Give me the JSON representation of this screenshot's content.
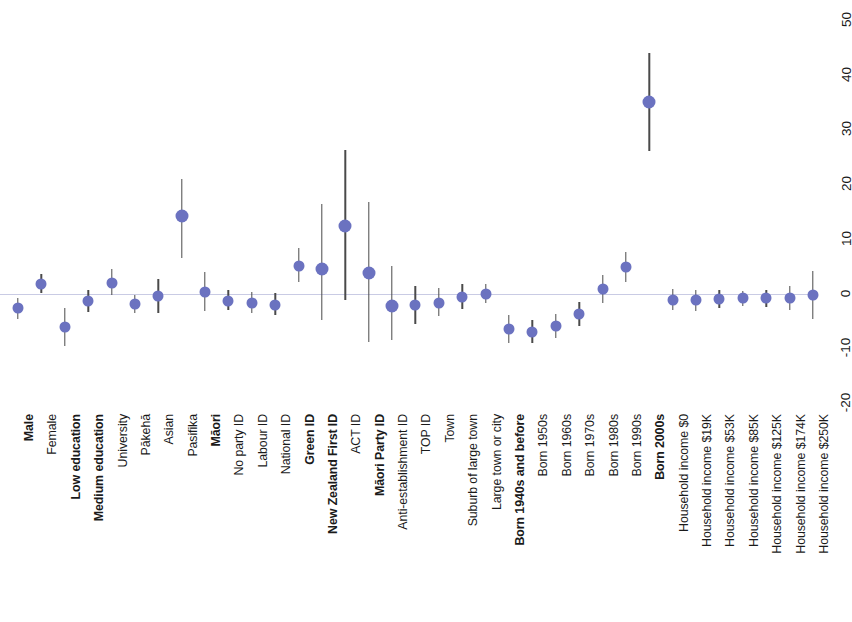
{
  "chart_data": {
    "type": "scatter",
    "title": "",
    "subtitle": "",
    "xlabel": "",
    "ylabel": "",
    "ylim": [
      -20,
      50
    ],
    "yticks": [
      -20,
      -10,
      0,
      10,
      20,
      30,
      40,
      50
    ],
    "grid": false,
    "legend": null,
    "zero_reference_line": 0,
    "point_color": "#6b72c0",
    "error_bar_color": "#4a4a4a",
    "zero_line_color": "#c9cbe4",
    "categories": [
      "Male",
      "Female",
      "Low education",
      "Medium education",
      "University",
      "Pākehā",
      "Asian",
      "Pasifika",
      "Māori",
      "No party ID",
      "Labour ID",
      "National ID",
      "Green ID",
      "New Zealand First ID",
      "ACT ID",
      "Māori Party ID",
      "Anti-establishment ID",
      "TOP ID",
      "Town",
      "Suburb of large town",
      "Large town or city",
      "Born 1940s and before",
      "Born 1950s",
      "Born 1960s",
      "Born 1970s",
      "Born 1980s",
      "Born 1990s",
      "Born 2000s",
      "Household income $0",
      "Household income $19K",
      "Household income $53K",
      "Household income $85K",
      "Household income $125K",
      "Household income $174K",
      "Household income $250K"
    ],
    "bold_categories": [
      "Male",
      "Low education",
      "Medium education",
      "Māori",
      "Green ID",
      "New Zealand First ID",
      "Māori Party ID",
      "Born 1940s and before",
      "Born 2000s"
    ],
    "points": [
      {
        "label": "Male",
        "value": -2.7,
        "low": -4.6,
        "high": -0.9
      },
      {
        "label": "Female",
        "value": 1.8,
        "low": 0.1,
        "high": 3.5
      },
      {
        "label": "Low education",
        "value": -6.1,
        "low": -9.5,
        "high": -2.7
      },
      {
        "label": "Medium education",
        "value": -1.3,
        "low": -3.3,
        "high": 0.7
      },
      {
        "label": "University",
        "value": 1.9,
        "low": -0.2,
        "high": 4.4
      },
      {
        "label": "Pākehā",
        "value": -1.9,
        "low": -3.5,
        "high": -0.3
      },
      {
        "label": "Asian",
        "value": -0.4,
        "low": -3.5,
        "high": 2.7
      },
      {
        "label": "Pasifika",
        "value": 14.2,
        "low": 6.5,
        "high": 21.0
      },
      {
        "label": "Māori",
        "value": 0.3,
        "low": -3.2,
        "high": 3.9
      },
      {
        "label": "No party ID",
        "value": -1.3,
        "low": -3.0,
        "high": 0.6
      },
      {
        "label": "Labour ID",
        "value": -1.7,
        "low": -3.5,
        "high": 0.2
      },
      {
        "label": "National ID",
        "value": -2.0,
        "low": -4.0,
        "high": 0.1
      },
      {
        "label": "Green ID",
        "value": 5.0,
        "low": 2.1,
        "high": 8.4
      },
      {
        "label": "New Zealand First ID",
        "value": 4.5,
        "low": -4.8,
        "high": 16.4
      },
      {
        "label": "ACT ID",
        "value": 12.3,
        "low": -1.2,
        "high": 26.2
      },
      {
        "label": "Māori Party ID",
        "value": 3.7,
        "low": -8.9,
        "high": 16.8
      },
      {
        "label": "Anti-establishment ID",
        "value": -2.3,
        "low": -8.5,
        "high": 5.0
      },
      {
        "label": "TOP ID",
        "value": -2.1,
        "low": -5.6,
        "high": 1.3
      },
      {
        "label": "Town",
        "value": -1.7,
        "low": -4.1,
        "high": 1.0
      },
      {
        "label": "Suburb of large town",
        "value": -0.6,
        "low": -2.9,
        "high": 1.8
      },
      {
        "label": "Large town or city",
        "value": -0.1,
        "low": -1.8,
        "high": 1.7
      },
      {
        "label": "Born 1940s and before",
        "value": -6.5,
        "low": -9.0,
        "high": -4.0
      },
      {
        "label": "Born 1950s",
        "value": -7.0,
        "low": -9.1,
        "high": -4.9
      },
      {
        "label": "Born 1960s",
        "value": -6.0,
        "low": -8.2,
        "high": -3.8
      },
      {
        "label": "Born 1970s",
        "value": -3.8,
        "low": -6.0,
        "high": -1.6
      },
      {
        "label": "Born 1980s",
        "value": 0.9,
        "low": -1.7,
        "high": 3.4
      },
      {
        "label": "Born 1990s",
        "value": 4.9,
        "low": 2.2,
        "high": 7.6
      },
      {
        "label": "Born 2000s",
        "value": 35.0,
        "low": 26.0,
        "high": 44.0
      },
      {
        "label": "Household income $0",
        "value": -1.1,
        "low": -3.0,
        "high": 0.8
      },
      {
        "label": "Household income $19K",
        "value": -1.2,
        "low": -3.2,
        "high": 0.7
      },
      {
        "label": "Household income $53K",
        "value": -1.0,
        "low": -2.6,
        "high": 0.6
      },
      {
        "label": "Household income $85K",
        "value": -0.9,
        "low": -2.3,
        "high": 0.5
      },
      {
        "label": "Household income $125K",
        "value": -0.9,
        "low": -2.5,
        "high": 0.7
      },
      {
        "label": "Household income $174K",
        "value": -0.8,
        "low": -3.0,
        "high": 1.4
      },
      {
        "label": "Household income $250K",
        "value": -0.3,
        "low": -4.6,
        "high": 4.1
      }
    ]
  }
}
